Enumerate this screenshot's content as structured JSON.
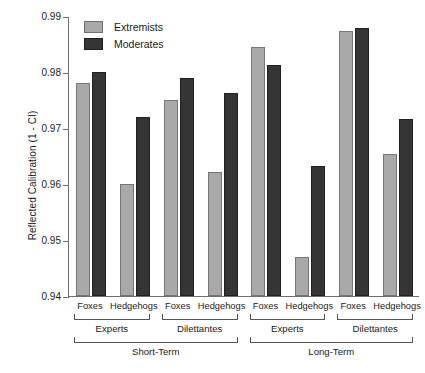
{
  "chart_data": {
    "type": "bar",
    "title": "",
    "xlabel": "",
    "ylabel": "Reflected Calibration (1 - CI)",
    "ylim": [
      0.94,
      0.99
    ],
    "yticks": [
      "0.94",
      "0.95",
      "0.96",
      "0.97",
      "0.98",
      "0.99"
    ],
    "ytick_values": [
      0.94,
      0.95,
      0.96,
      0.97,
      0.98,
      0.99
    ],
    "grid": false,
    "legend_position": "top-left",
    "legend": [
      "Extremists",
      "Moderates"
    ],
    "series": [
      {
        "name": "Extremists",
        "color": "#a9a9a9",
        "values": [
          0.978,
          0.96,
          0.975,
          0.9621,
          0.9844,
          0.947,
          0.9873,
          0.9654
        ]
      },
      {
        "name": "Moderates",
        "color": "#353535",
        "values": [
          0.98,
          0.972,
          0.979,
          0.9763,
          0.9812,
          0.9633,
          0.9879,
          0.9716
        ]
      }
    ],
    "categories": [
      "Foxes",
      "Hedgehogs",
      "Foxes",
      "Hedgehogs",
      "Foxes",
      "Hedgehogs",
      "Foxes",
      "Hedgehogs"
    ],
    "group_level2": [
      "Experts",
      "Dilettantes",
      "Experts",
      "Dilettantes"
    ],
    "group_level3": [
      "Short-Term",
      "Long-Term"
    ]
  },
  "axis": {
    "ytitle": "Reflected Calibration (1 - CI)",
    "ticks": [
      {
        "label": "0.99"
      },
      {
        "label": "0.98"
      },
      {
        "label": "0.97"
      },
      {
        "label": "0.96"
      },
      {
        "label": "0.95"
      },
      {
        "label": "0.94"
      }
    ]
  },
  "legend": {
    "items": [
      {
        "label": "Extremists",
        "color": "#a9a9a9"
      },
      {
        "label": "Moderates",
        "color": "#353535"
      }
    ]
  },
  "xlabels": {
    "level1": [
      {
        "label": "Foxes"
      },
      {
        "label": "Hedgehogs"
      },
      {
        "label": "Foxes"
      },
      {
        "label": "Hedgehogs"
      },
      {
        "label": "Foxes"
      },
      {
        "label": "Hedgehogs"
      },
      {
        "label": "Foxes"
      },
      {
        "label": "Hedgehogs"
      }
    ],
    "level2": [
      {
        "label": "Experts"
      },
      {
        "label": "Dilettantes"
      },
      {
        "label": "Experts"
      },
      {
        "label": "Dilettantes"
      }
    ],
    "level3": [
      {
        "label": "Short-Term"
      },
      {
        "label": "Long-Term"
      }
    ]
  }
}
